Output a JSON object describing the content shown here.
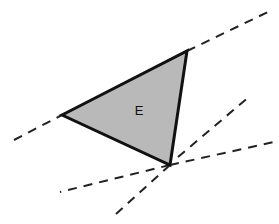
{
  "diagram": {
    "region_label": "E",
    "colors": {
      "fill": "#b9b9b9",
      "stroke": "#111111",
      "dash": "#222222",
      "background": "#ffffff"
    },
    "triangle": {
      "vertices": [
        [
          62,
          115
        ],
        [
          187,
          51
        ],
        [
          170,
          165
        ]
      ]
    },
    "dashed_lines": [
      {
        "from": [
          14,
          140
        ],
        "to": [
          62,
          115
        ]
      },
      {
        "from": [
          187,
          51
        ],
        "to": [
          272,
          10
        ]
      },
      {
        "from": [
          170,
          165
        ],
        "to": [
          60,
          192
        ]
      },
      {
        "from": [
          170,
          165
        ],
        "to": [
          274,
          142
        ]
      },
      {
        "from": [
          178,
          157
        ],
        "to": [
          250,
          96
        ]
      },
      {
        "from": [
          170,
          165
        ],
        "to": [
          116,
          214
        ]
      }
    ]
  }
}
